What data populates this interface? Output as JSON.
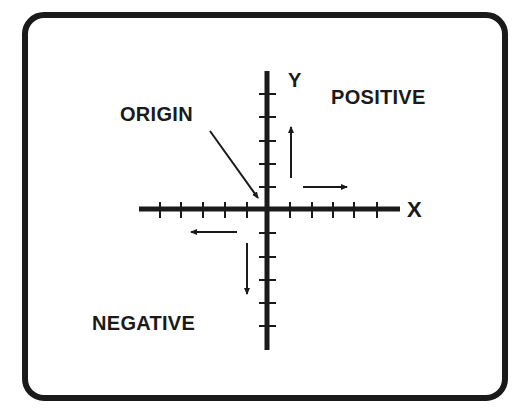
{
  "diagram": {
    "type": "coordinate-axes",
    "labels": {
      "x_axis": "X",
      "y_axis": "Y",
      "origin": "ORIGIN",
      "positive": "POSITIVE",
      "negative": "NEGATIVE"
    },
    "axes": {
      "origin_px": [
        267,
        209
      ],
      "x_axis_extent_px": [
        139,
        400
      ],
      "y_axis_extent_px": [
        71,
        350
      ],
      "x_ticks_px": [
        160,
        181,
        203,
        225,
        247,
        290,
        312,
        333,
        354,
        377
      ],
      "y_ticks_px": [
        94,
        117,
        141,
        164,
        187,
        233,
        257,
        280,
        303,
        326
      ]
    },
    "arrows": [
      {
        "name": "positive-y-direction",
        "from": [
          291,
          178
        ],
        "to": [
          291,
          126
        ]
      },
      {
        "name": "positive-x-direction",
        "from": [
          303,
          187
        ],
        "to": [
          348,
          187
        ]
      },
      {
        "name": "negative-x-direction",
        "from": [
          237,
          232
        ],
        "to": [
          190,
          232
        ]
      },
      {
        "name": "negative-y-direction",
        "from": [
          247,
          243
        ],
        "to": [
          247,
          295
        ]
      },
      {
        "name": "origin-pointer",
        "from": [
          210,
          131
        ],
        "to": [
          259,
          199
        ]
      }
    ],
    "colors": {
      "ink": "#1a1a1a",
      "background": "#ffffff"
    }
  }
}
